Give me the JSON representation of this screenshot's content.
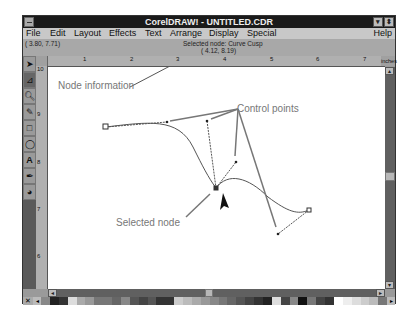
{
  "window": {
    "title": "CorelDRAW! - UNTITLED.CDR"
  },
  "menu": [
    "File",
    "Edit",
    "Layout",
    "Effects",
    "Text",
    "Arrange",
    "Display",
    "Special",
    "Help"
  ],
  "status": {
    "cursor_coords": "( 3.80, 7.71)",
    "selected_node": "Selected node: Curve Cusp",
    "node_coords": "( 4.12, 8.19)"
  },
  "ruler": {
    "h_ticks": [
      "1",
      "2",
      "3",
      "4",
      "5",
      "6",
      "7"
    ],
    "units": "inches",
    "v_ticks": [
      "10",
      "9",
      "8",
      "7",
      "6"
    ]
  },
  "toolbox": [
    "pick-tool",
    "shape-tool",
    "zoom-tool",
    "pencil-tool",
    "rectangle-tool",
    "ellipse-tool",
    "text-tool",
    "outline-tool",
    "fill-tool"
  ],
  "annotations": {
    "node_information": "Node information",
    "control_points": "Control points",
    "selected_node": "Selected node"
  },
  "palette": [
    "#888",
    "#222",
    "#333",
    "#ddd",
    "#aaa",
    "#999",
    "#777",
    "#777",
    "#666",
    "#888",
    "#555",
    "#444",
    "#555",
    "#333",
    "#333",
    "#ccc",
    "#bbb",
    "#aaa",
    "#999",
    "#888",
    "#777",
    "#666",
    "#555",
    "#444",
    "#333",
    "#222",
    "#ddd",
    "#444",
    "#888",
    "#111",
    "#777",
    "#444",
    "#333",
    "#fff",
    "#eee",
    "#ddd",
    "#ccc",
    "#bbb",
    "#777"
  ]
}
